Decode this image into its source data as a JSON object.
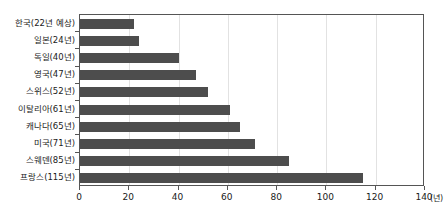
{
  "chart_data": {
    "type": "bar",
    "orientation": "horizontal",
    "title": "",
    "xlabel": "",
    "ylabel": "",
    "unit_label": "(년)",
    "xlim": [
      0,
      140
    ],
    "xticks": [
      0,
      20,
      40,
      60,
      80,
      100,
      120,
      140
    ],
    "xtick_labels": [
      "0",
      "20",
      "40",
      "60",
      "80",
      "100",
      "120",
      "140"
    ],
    "grid": true,
    "legend": false,
    "bar_color": "#4d4d4d",
    "grid_color": "#e2e2e2",
    "axis_color": "#555555",
    "categories": [
      "한국(22년 예상)",
      "일본(24년)",
      "독일(40년)",
      "영국(47년)",
      "스위스(52년)",
      "이탈리아(61년)",
      "캐나다(65년)",
      "미국(71년)",
      "스웨덴(85년)",
      "프랑스(115년)"
    ],
    "values": [
      22,
      24,
      40,
      47,
      52,
      61,
      65,
      71,
      85,
      115
    ]
  }
}
